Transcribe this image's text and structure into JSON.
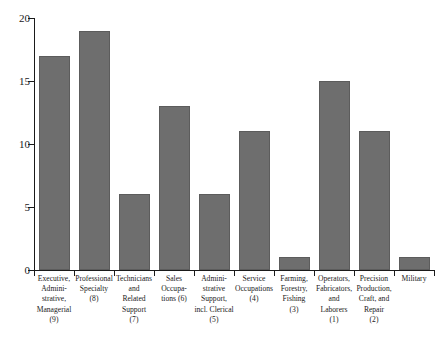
{
  "chart_data": {
    "type": "bar",
    "title": "",
    "xlabel": "",
    "ylabel": "",
    "ylim": [
      0,
      20
    ],
    "ytick_labels": [
      "0",
      "5",
      "10",
      "15",
      "20"
    ],
    "ytick_values": [
      0,
      5,
      10,
      15,
      20
    ],
    "grid": false,
    "legend": null,
    "bar_color": "#6e6e6e",
    "bar_edge_color": "#5c5c5c",
    "axis_color": "#1a1a1a",
    "background_color": "#ffffff",
    "categories": [
      "Executive,\nAdmini-\nstrative,\nManagerial\n(9)",
      "Professional\nSpecialty\n(8)",
      "Technicians\nand\nRelated\nSupport\n(7)",
      "Sales\nOccupa-\ntions (6)",
      "Admini-\nstrative\nSupport,\nincl. Clerical\n(5)",
      "Service\nOccupations\n(4)",
      "Farming,\nForestry,\nFishing\n(3)",
      "Operators,\nFabricators,\nand\nLaborers\n(1)",
      "Precision\nProduction,\nCraft, and\nRepair\n(2)",
      "Military"
    ],
    "category_names": [
      "Executive, Administrative, Managerial",
      "Professional Specialty",
      "Technicians and Related Support",
      "Sales Occupations",
      "Administrative Support, incl. Clerical",
      "Service Occupations",
      "Farming, Forestry, Fishing",
      "Operators, Fabricators, and Laborers",
      "Precision Production, Craft, and Repair",
      "Military"
    ],
    "category_codes": [
      "9",
      "8",
      "7",
      "6",
      "5",
      "4",
      "3",
      "1",
      "2",
      ""
    ],
    "values": [
      17,
      19,
      6,
      13,
      6,
      11,
      1,
      15,
      11,
      1
    ]
  }
}
